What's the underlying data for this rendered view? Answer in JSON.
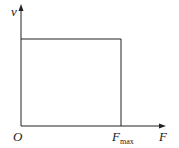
{
  "diagram": {
    "type": "v-F graph",
    "axes": {
      "y_label": "v",
      "x_label": "F",
      "origin_label": "O"
    },
    "marker": {
      "label_main": "F",
      "label_sub": "max"
    },
    "shape": "rectangle from origin to (Fmax, constant v)",
    "colors": {
      "line": "#222222",
      "background": "#ffffff"
    }
  }
}
